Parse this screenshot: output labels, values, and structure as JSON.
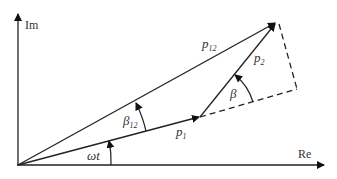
{
  "diagram": {
    "type": "phasor-diagram",
    "axes": {
      "imaginary_label": "Im",
      "real_label": "Re"
    },
    "vectors": [
      {
        "id": "p1",
        "label": "p",
        "subscript": "1",
        "style": "solid",
        "from": "origin",
        "to": "end-of-p1"
      },
      {
        "id": "p2",
        "label": "p",
        "subscript": "2",
        "style": "solid",
        "from": "end-of-p1",
        "to": "tip"
      },
      {
        "id": "p12",
        "label": "p",
        "subscript": "12",
        "style": "solid",
        "from": "origin",
        "to": "tip"
      }
    ],
    "construction_lines": [
      {
        "style": "dashed",
        "description": "extension of p1"
      },
      {
        "style": "dashed",
        "description": "projection to tip"
      }
    ],
    "angles": [
      {
        "id": "omega_t",
        "label": "ωt",
        "between": "Re axis and p1"
      },
      {
        "id": "beta12",
        "label": "β",
        "subscript": "12",
        "between": "p1 and p12"
      },
      {
        "id": "beta",
        "label": "β",
        "between": "p1 extension and p2"
      }
    ],
    "colors": {
      "line": "#222222",
      "text": "#333333",
      "background": "#ffffff"
    }
  }
}
